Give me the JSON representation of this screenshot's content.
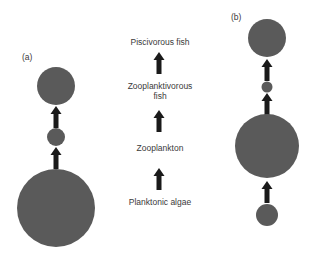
{
  "panels": {
    "a": {
      "label": "(a)"
    },
    "b": {
      "label": "(b)"
    }
  },
  "trophic_levels": [
    {
      "name": "Piscivorous fish"
    },
    {
      "name": "Zooplanktivorous fish"
    },
    {
      "name": "Zooplankton"
    },
    {
      "name": "Planktonic algae"
    }
  ],
  "labels": {
    "piscivorous": "Piscivorous fish",
    "zooplanktivorous_line1": "Zooplanktivorous",
    "zooplanktivorous_line2": "fish",
    "zooplankton": "Zooplankton",
    "algae": "Planktonic algae"
  },
  "colors": {
    "circle": "#5a5a5a",
    "arrow": "#1a1a1a",
    "text": "#3a3a3a"
  }
}
